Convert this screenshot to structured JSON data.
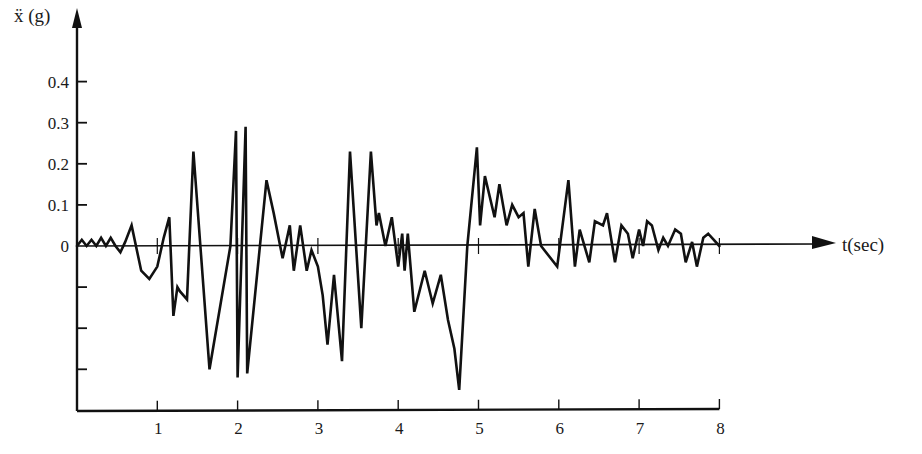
{
  "chart_data": {
    "type": "line",
    "title": "",
    "xlabel": "t(sec)",
    "ylabel": "ẍ (g)",
    "xlim": [
      0,
      8
    ],
    "ylim": [
      -0.35,
      0.45
    ],
    "grid": false,
    "legend": null,
    "x_ticks": [
      1,
      2,
      3,
      4,
      5,
      6,
      7,
      8
    ],
    "x_tick_labels": [
      "1",
      "2",
      "3",
      "4",
      "5",
      "6",
      "7",
      "8"
    ],
    "y_ticks": [
      0.4,
      0.3,
      0.2,
      0.1,
      0,
      -0.1,
      -0.2,
      -0.3
    ],
    "y_tick_labels": [
      "0.4",
      "0.3",
      "0.2",
      "0.1",
      "0",
      "",
      "",
      ""
    ],
    "series": [
      {
        "name": "ground acceleration",
        "color": "#111111",
        "t": [
          0.0,
          0.06,
          0.12,
          0.18,
          0.24,
          0.3,
          0.36,
          0.42,
          0.48,
          0.54,
          0.6,
          0.68,
          0.8,
          0.9,
          1.0,
          1.08,
          1.15,
          1.2,
          1.25,
          1.28,
          1.37,
          1.45,
          1.65,
          1.91,
          1.98,
          2.0,
          2.1,
          2.12,
          2.36,
          2.45,
          2.56,
          2.65,
          2.7,
          2.78,
          2.86,
          2.92,
          3.0,
          3.06,
          3.12,
          3.2,
          3.3,
          3.4,
          3.54,
          3.66,
          3.73,
          3.76,
          3.84,
          3.92,
          4.0,
          4.05,
          4.08,
          4.12,
          4.2,
          4.33,
          4.43,
          4.53,
          4.62,
          4.7,
          4.76,
          4.86,
          4.98,
          5.02,
          5.08,
          5.2,
          5.26,
          5.35,
          5.42,
          5.5,
          5.56,
          5.62,
          5.7,
          5.78,
          5.98,
          6.12,
          6.2,
          6.26,
          6.38,
          6.45,
          6.55,
          6.6,
          6.7,
          6.78,
          6.86,
          6.92,
          7.0,
          7.05,
          7.1,
          7.16,
          7.24,
          7.3,
          7.36,
          7.45,
          7.52,
          7.58,
          7.66,
          7.72,
          7.8,
          7.86,
          8.0
        ],
        "values": [
          0,
          0.015,
          0,
          0.015,
          0,
          0.02,
          0,
          0.02,
          0,
          -0.015,
          0.01,
          0.05,
          -0.06,
          -0.08,
          -0.05,
          0.02,
          0.07,
          -0.17,
          -0.1,
          -0.11,
          -0.13,
          0.23,
          -0.3,
          0,
          0.28,
          -0.32,
          0.29,
          -0.31,
          0.16,
          0.08,
          -0.03,
          0.05,
          -0.06,
          0.05,
          -0.06,
          -0.01,
          -0.05,
          -0.12,
          -0.24,
          -0.07,
          -0.28,
          0.23,
          -0.2,
          0.23,
          0.05,
          0.08,
          0,
          0.07,
          -0.05,
          0.03,
          -0.06,
          0.03,
          -0.16,
          -0.06,
          -0.14,
          -0.07,
          -0.18,
          -0.25,
          -0.35,
          0.0,
          0.24,
          0.05,
          0.17,
          0.07,
          0.15,
          0.05,
          0.1,
          0.07,
          0.08,
          -0.05,
          0.09,
          0,
          -0.05,
          0.16,
          -0.05,
          0.04,
          -0.04,
          0.06,
          0.05,
          0.08,
          -0.04,
          0.05,
          0.03,
          -0.03,
          0.04,
          0.0,
          0.06,
          0.05,
          -0.01,
          0.02,
          0,
          0.04,
          0.03,
          -0.04,
          0.01,
          -0.05,
          0.02,
          0.03,
          0
        ]
      }
    ]
  },
  "axes": {
    "y_label": "ẍ (g)",
    "x_label": "t(sec)"
  }
}
